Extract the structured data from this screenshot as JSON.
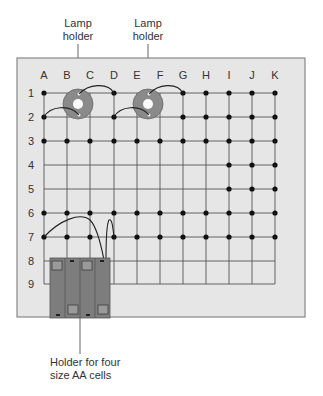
{
  "labels": {
    "lamp_holder_1": [
      "Lamp",
      "holder"
    ],
    "lamp_holder_2": [
      "Lamp",
      "holder"
    ],
    "battery_holder": [
      "Holder for four",
      "size AA cells"
    ]
  },
  "grid": {
    "columns": [
      "A",
      "B",
      "C",
      "D",
      "E",
      "F",
      "G",
      "H",
      "I",
      "J",
      "K"
    ],
    "rows": [
      "1",
      "2",
      "3",
      "4",
      "5",
      "6",
      "7",
      "8",
      "9"
    ]
  },
  "colors": {
    "panel": "#e6e6e6",
    "panel_border": "#888888",
    "grid_line": "#555555",
    "node": "#111111",
    "lamp_holder": "#8a8a8a",
    "battery": "#7d7d7d"
  }
}
